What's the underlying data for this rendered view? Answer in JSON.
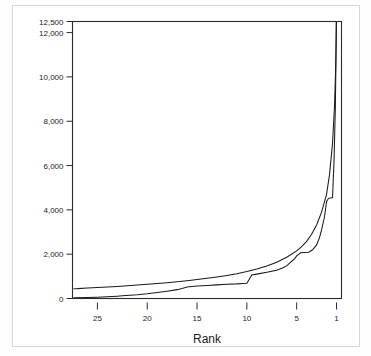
{
  "figure": {
    "background_color": "#ffffff",
    "border_color": "#d8d8d8",
    "line_color": "#1a1a1a"
  },
  "chart_data": {
    "type": "line",
    "title": "",
    "subtitle": "",
    "xlabel": "Rank",
    "ylabel": "",
    "grid": false,
    "legend": "none",
    "x_axis_reversed": true,
    "xlim": [
      27.5,
      0.5
    ],
    "ylim": [
      0,
      12500
    ],
    "xticks": [
      25,
      20,
      15,
      10,
      5,
      1
    ],
    "xticklabels": [
      "25",
      "20",
      "15",
      "10",
      "5",
      "1"
    ],
    "yticks": [
      0,
      2000,
      4000,
      6000,
      8000,
      10000,
      12000,
      12500
    ],
    "yticklabels": [
      "0",
      "2,000",
      "4,000",
      "6,000",
      "8,000",
      "10,000",
      "12,000",
      "12,500"
    ],
    "annotations": [],
    "series": [
      {
        "name": "smooth-curve",
        "x": [
          27.4,
          27,
          26,
          25,
          24,
          23,
          22,
          21,
          20,
          19,
          18,
          17,
          16,
          15,
          14,
          13,
          12,
          11,
          10,
          9,
          8,
          7,
          6,
          5,
          4.5,
          4,
          3.5,
          3,
          2.5,
          2,
          1.7,
          1.4,
          1.2,
          1.1,
          1.05,
          1.0
        ],
        "y": [
          440,
          445,
          470,
          495,
          520,
          545,
          575,
          605,
          640,
          675,
          715,
          760,
          805,
          855,
          910,
          970,
          1040,
          1120,
          1215,
          1330,
          1470,
          1640,
          1860,
          2150,
          2340,
          2580,
          2900,
          3320,
          3900,
          4700,
          5600,
          7000,
          8700,
          10200,
          11400,
          13200
        ]
      },
      {
        "name": "stepped-curve",
        "x": [
          27.4,
          26,
          25,
          24,
          23,
          22.5,
          21,
          20,
          19,
          18,
          17,
          16.5,
          16,
          15,
          14,
          13,
          12,
          11,
          10.4,
          10,
          9.5,
          9,
          8,
          7,
          6.3,
          6,
          5.6,
          5.2,
          5.0,
          4.6,
          4.2,
          3.8,
          3.4,
          3.0,
          2.7,
          2.5,
          2.2,
          2.0,
          1.8,
          1.6,
          1.4,
          1.25,
          1.12,
          1.05,
          1.0
        ],
        "y": [
          30,
          45,
          60,
          80,
          105,
          120,
          165,
          210,
          270,
          330,
          400,
          455,
          520,
          560,
          590,
          615,
          640,
          660,
          680,
          690,
          1060,
          1100,
          1180,
          1280,
          1400,
          1470,
          1640,
          1800,
          1920,
          2060,
          2080,
          2090,
          2200,
          2420,
          2760,
          3100,
          3700,
          4380,
          4520,
          4540,
          4560,
          6200,
          8600,
          10800,
          13200
        ]
      }
    ]
  }
}
